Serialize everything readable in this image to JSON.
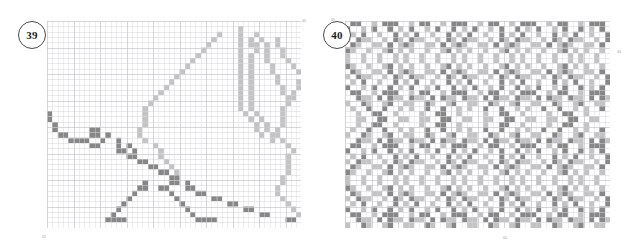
{
  "page": {
    "background": "#ffffff"
  },
  "colors": {
    "dark": "#878787",
    "light": "#c3c3c6",
    "empty": "#ffffff",
    "grid": "#d6d6d9",
    "grid_major": "#c4c4c8",
    "badge_border": "#4a4a4a",
    "badge_text": "#1d1d1d",
    "corner_mark": "#9a9a9a"
  },
  "charts": [
    {
      "id": "chart-39",
      "number": "39",
      "cols": 48,
      "rows": 39,
      "cell": 5.3,
      "corner_marks": [
        {
          "name": "mark-39-tr",
          "text": "40"
        },
        {
          "name": "mark-39-bl",
          "text": "42"
        }
      ],
      "legend": {
        "dark": "dark grey stitch",
        "light": "light grey stitch"
      },
      "grid_runs": [
        "48e",
        "36e,1l,11e",
        "32e,1l,3e,1l,2e,1l,7e",
        "31e,1l,4e,1l,1e,1l,1e,1l,2e,1l,5e",
        "30e,1l,5e,1l,1e,2l,1e,1l,1e,1l,5e",
        "29e,1l,6e,1l,2e,1l,1e,1l,2e,1l,4e",
        "28e,1l,7e,1l,1e,1l,2e,1l,2e,1l,3e",
        "27e,1l,8e,1l,1e,1l,2e,1l,3e,1l,2e",
        "26e,1l,9e,1l,1e,1l,3e,1l,3e,1l,1e",
        "25e,1l,10e,1l,1e,1l,3e,1l,4e,1l",
        "24e,1l,11e,1l,1e,1l,4e,1l,4e",
        "23e,1l,12e,1l,1e,1l,4e,1l,3e,1l",
        "22e,1l,13e,1l,1e,1l,5e,1l,2e,1l,1e",
        "21e,1l,14e,1l,1e,1l,5e,1l,1e,1l,2e",
        "20e,1l,15e,1l,1e,1l,6e,2l,3e",
        "19e,1l,16e,1l,1e,1l,6e,1l,4e",
        "18e,1l,17e,1l,1e,1l,5e,1l,5e",
        "1d,17e,1l,18e,1l,1e,1l,4e,1l,5e",
        "1d,17e,1l,19e,1l,1e,1l,3e,1l,5e",
        "1e,1d,16e,1l,20e,1l,1e,1l,2e,1l,5e",
        "1e,1d,6e,2d,7e,1l,21e,1l,1e,1l,1e,1l,5e",
        "2e,2d,4e,2d,1e,1d,5e,1l,22e,1l,1e,2l,5e",
        "4e,4d,2e,1d,2e,1d,4e,1l,23e,1l,1e,1l,5e",
        "8e,2d,3e,1d,1e,1d,4e,1l,24e,1l,6e",
        "13e,2d,1e,1d,4e,1l,24e,1l,1e,1l,4e",
        "15e,2d,4e,1l,23e,1l,2e,1l,4e",
        "17e,2d,3e,1l,22e,1l,3e,1l,4e",
        "19e,2d,2e,1l,21e,1l,4e,1l,4e",
        "21e,2d,1e,1l,20e,1l,5e,1l,4e",
        "23e,2d,19e,1l,6e,1l,4e",
        "18e,1d,4e,2d,1e,1d,17e,1l,7e,1l,4e",
        "17e,2d,2e,2d,3e,2d,15e,1l,8e,1l,4e",
        "16e,1d,6e,1d,4e,2d,13e,1l,9e,1l,4e",
        "15e,1d,8e,1d,6e,2d,11e,1l,10e,1l,4e",
        "14e,1d,10e,1d,8e,2d,9e,1l,11e,1l,4e",
        "13e,1d,12e,1d,10e,2d,7e,1l,12e,1l,4e",
        "12e,1d,14e,1d,12e,2d,5e,1l,13e,1l,4e",
        "11e,4d,13e,4d,13e,2d,3e,1l,14e,1l,3e",
        "48e"
      ]
    },
    {
      "id": "chart-40",
      "number": "40",
      "cols": 50,
      "rows": 39,
      "cell": 5.3,
      "corner_marks": [
        {
          "name": "mark-40-tl",
          "text": "40"
        },
        {
          "name": "mark-40-r",
          "text": "34"
        },
        {
          "name": "mark-40-b",
          "text": "00"
        }
      ],
      "legend": {
        "dark": "dark grey stitch",
        "light": "light grey stitch"
      },
      "grid_runs": [
        "1e,2d,2e,1l,1e,3d,2e,1l,1e,2d,2e,1l,1e,3d,2e,1l,1e,2d,2e,1l,1e,3d,2e,1l,1e,2d,2e,1l,1e,3d,2e,1l,1e,2d,2e,1l,1e,2d",
        "1d,2e,1l,1e,1d,2e,1d,1e,1l,1e,1d,2e,1l,1e,1d,2e,1d,1e,1l,1e,1d,2e,1l,1e,1d,2e,1d,1e,1l,1e,1d,2e,1l,1e,1d,2e,1d,1e,1l,1e,1d,2e,1l,1e,1d,1e",
        "1e,1l,1e,1d,2e,1l,2e,1d,1e,1l,1e,1d,2e,1l,2e,1d,1e,1l,1e,1d,2e,1l,2e,1d,1e,1l,1e,1d,2e,1l,2e,1d,1e,1l,1e,1d,2e,1l,2e,1d,1e,1l,1e,1d,2e,1l,2e,1d",
        "1l,1e,1d,2l,2e,1l,1e,1d,1l,1e,1d,2l,2e,1l,1e,1d,1l,1e,1d,2l,2e,1l,1e,1d,1l,1e,1d,2l,2e,1l,1e,1d,1l,1e,1d,2l,2e,1l,1e,1d,1l,1e,1d,1l",
        "1e,1d,1l,2e,2l,1e,1d,1e,1l,1d,1l,2e,2l,1e,1d,1e,1l,1d,1l,2e,2l,1e,1d,1e,1l,1d,1l,2e,2l,1e,1d,1e,1l,1d,1l,2e,2l,1e,1d,1e,1l,1d,1l,2e,2l,1e,1d",
        "1d,1l,2e,1l,2e,1l,1d,1e,1l,1e,1l,2e,1l,2e,1l,1d,1e,1l,1e,1l,2e,1l,2e,1l,1d,1e,1l,1e,1l,2e,1l,2e,1l,1d,1e,1l,1e,1l,2e,1l,2e,1l,1d,1e,1l,1e,1l,1e",
        "1l,2e,1l,2e,1l,2e,1l,1e,1l,2e,1l,2e,1l,2e,1l,1e,1l,2e,1l,2e,1l,2e,1l,1e,1l,2e,1l,2e,1l,2e,1l,1e,1l,2e,1l,2e,1l,2e,1l,1e,1l,2e,1l,2e,1l,1e",
        "1l,2e,1l,2e,1l,2e,1l,1e,1l,2e,1l,2e,1l,2e,1l,1e,1l,2e,1l,2e,1l,2e,1l,1e,1l,2e,1l,2e,1l,2e,1l,1e,1l,2e,1l,2e,1l,2e,1l,1e,1l,2e,1l,2e,1l,1e",
        "1d,1l,2e,1l,2e,1l,1d,1e,1l,1e,1l,2e,1l,2e,1l,1d,1e,1l,1e,1l,2e,1l,2e,1l,1d,1e,1l,1e,1l,2e,1l,2e,1l,1d,1e,1l,1e,1l,2e,1l,2e,1l,1d,1e,1l,1e,1l,1e",
        "1e,1d,1l,2e,2l,1e,1d,1e,1l,1d,1l,2e,2l,1e,1d,1e,1l,1d,1l,2e,2l,1e,1d,1e,1l,1d,1l,2e,2l,1e,1d,1e,1l,1d,1l,2e,2l,1e,1d,1e,1l,1d,1l,2e,2l,1e,1d",
        "1l,1e,1d,2l,2e,1l,1e,1d,1l,1e,1d,2l,2e,1l,1e,1d,1l,1e,1d,2l,2e,1l,1e,1d,1l,1e,1d,2l,2e,1l,1e,1d,1l,1e,1d,2l,2e,1l,1e,1d,1l,1e,1d,1l",
        "1e,1l,1e,1d,2e,1l,2e,1d,1e,1l,1e,1d,2e,1l,2e,1d,1e,1l,1e,1d,2e,1l,2e,1d,1e,1l,1e,1d,2e,1l,2e,1d,1e,1l,1e,1d,2e,1l,2e,1d,1e,1l,1e,1d,2e,1l,2e,1d",
        "1d,2e,1l,1e,1d,2e,1d,1e,1l,1e,1d,2e,1l,1e,1d,2e,1d,1e,1l,1e,1d,2e,1l,1e,1d,2e,1d,1e,1l,1e,1d,2e,1l,1e,1d,2e,1d,1e,1l,1e,1d,2e,1l,1e,1d,1e",
        "1e,2d,2e,1l,1e,3d,2e,1l,1e,2d,2e,1l,1e,3d,2e,1l,1e,2d,2e,1l,1e,3d,2e,1l,1e,2d,2e,1l,1e,3d,2e,1l,1e,2d,2e,1l,1e,2d",
        "2e,1d,2l,1e,1d,1e,1d,2l,1e,1d,2l,1e,1d,1e,1d,2l,1e,1d,2l,1e,1d,1e,1d,2l,1e,1d,2l,1e,1d,1e,1d,2l,1e,1d,2l,1e,1d,1e,1d,2l,1e,1d,2l,1e,1d,1e",
        "1l,2e,1d,1l,2e,1l,1d,2e,1l,1l,2e,1d,1l,2e,1l,1d,2e,1l,1l,2e,1d,1l,2e,1l,1d,2e,1l,1l,2e,1d,1l,2e,1l,1d,2e,1l,1l,2e,1d,1l,2e,1l,1d,1e",
        "1e,1l,2e,1d,2e,1d,2e,1l,1e,1l,2e,1d,2e,1d,2e,1l,1e,1l,2e,1d,2e,1d,2e,1l,1e,1l,2e,1d,2e,1d,2e,1l,1e,1l,2e,1d,2e,1d,2e,1l,1e,1l,2e,1d,2e,1d",
        "2e,1l,2e,2d,2e,1l,2e,2e,1l,2e,2d,2e,1l,2e,2e,1l,2e,2d,2e,1l,2e,2e,1l,2e,2d,2e,1l,2e,2e,1l,2e,2d,2e,1l,2e,2e,1l,2e,2d,2e",
        "2e,2l,2e,2d,2e,2l,2e,2l,2e,2d,2e,2l,2e,2l,2e,2d,2e,2l,2e,2l,2e,2d,2e,2l,2e,2l,2e,2d,2e,2l,2e,2l,2e,2d,2e",
        "2e,1l,2e,2d,2e,1l,2e,2e,1l,2e,2d,2e,1l,2e,2e,1l,2e,2d,2e,1l,2e,2e,1l,2e,2d,2e,1l,2e,2e,1l,2e,2d,2e,1l,2e,2e,1l,2e,2d,2e",
        "1e,1l,2e,1d,2e,1d,2e,1l,1e,1l,2e,1d,2e,1d,2e,1l,1e,1l,2e,1d,2e,1d,2e,1l,1e,1l,2e,1d,2e,1d,2e,1l,1e,1l,2e,1d,2e,1d,2e,1l,1e,1l,2e,1d,2e,1d",
        "1l,2e,1d,1l,2e,1l,1d,2e,1l,1l,2e,1d,1l,2e,1l,1d,2e,1l,1l,2e,1d,1l,2e,1l,1d,2e,1l,1l,2e,1d,1l,2e,1l,1d,2e,1l,1l,2e,1d,1l,2e,1l,1d,1e",
        "2e,1d,2l,1e,1d,1e,1d,2l,1e,1d,2l,1e,1d,1e,1d,2l,1e,1d,2l,1e,1d,1e,1d,2l,1e,1d,2l,1e,1d,1e,1d,2l,1e,1d,2l,1e,1d,1e,1d,2l,1e,1d,2l,1e,1d,1e",
        "1e,2d,2e,1l,1e,3d,2e,1l,1e,2d,2e,1l,1e,3d,2e,1l,1e,2d,2e,1l,1e,3d,2e,1l,1e,2d,2e,1l,1e,3d,2e,1l,1e,2d,2e,1l,1e,2d",
        "1d,2e,1l,1e,1d,2e,1d,1e,1l,1e,1d,2e,1l,1e,1d,2e,1d,1e,1l,1e,1d,2e,1l,1e,1d,2e,1d,1e,1l,1e,1d,2e,1l,1e,1d,2e,1d,1e,1l,1e,1d,2e,1l,1e,1d,1e",
        "1e,1l,1e,1d,2e,1l,2e,1d,1e,1l,1e,1d,2e,1l,2e,1d,1e,1l,1e,1d,2e,1l,2e,1d,1e,1l,1e,1d,2e,1l,2e,1d,1e,1l,1e,1d,2e,1l,2e,1d,1e,1l,1e,1d,2e,1l,2e,1d",
        "1l,1e,1d,2l,2e,1l,1e,1d,1l,1e,1d,2l,2e,1l,1e,1d,1l,1e,1d,2l,2e,1l,1e,1d,1l,1e,1d,2l,2e,1l,1e,1d,1l,1e,1d,2l,2e,1l,1e,1d,1l,1e,1d,1l",
        "1e,1d,1l,2e,2l,1e,1d,1e,1l,1d,1l,2e,2l,1e,1d,1e,1l,1d,1l,2e,2l,1e,1d,1e,1l,1d,1l,2e,2l,1e,1d,1e,1l,1d,1l,2e,2l,1e,1d,1e,1l,1d,1l,2e,2l,1e,1d",
        "1d,1l,2e,1l,2e,1l,1d,1e,1l,1e,1l,2e,1l,2e,1l,1d,1e,1l,1e,1l,2e,1l,2e,1l,1d,1e,1l,1e,1l,2e,1l,2e,1l,1d,1e,1l,1e,1l,2e,1l,2e,1l,1d,1e,1l,1e,1l,1e",
        "1l,2e,1l,2e,1l,2e,1l,1e,1l,2e,1l,2e,1l,2e,1l,1e,1l,2e,1l,2e,1l,2e,1l,1e,1l,2e,1l,2e,1l,2e,1l,1e,1l,2e,1l,2e,1l,2e,1l,1e,1l,2e,1l,2e,1l,1e",
        "1l,2e,1l,2e,1l,2e,1l,1e,1l,2e,1l,2e,1l,2e,1l,1e,1l,2e,1l,2e,1l,2e,1l,1e,1l,2e,1l,2e,1l,2e,1l,1e,1l,2e,1l,2e,1l,2e,1l,1e,1l,2e,1l,2e,1l,1e",
        "1d,1l,2e,1l,2e,1l,1d,1e,1l,1e,1l,2e,1l,2e,1l,1d,1e,1l,1e,1l,2e,1l,2e,1l,1d,1e,1l,1e,1l,2e,1l,2e,1l,1d,1e,1l,1e,1l,2e,1l,2e,1l,1d,1e,1l,1e,1l,1e",
        "1e,1d,1l,2e,2l,1e,1d,1e,1l,1d,1l,2e,2l,1e,1d,1e,1l,1d,1l,2e,2l,1e,1d,1e,1l,1d,1l,2e,2l,1e,1d,1e,1l,1d,1l,2e,2l,1e,1d,1e,1l,1d,1l,2e,2l,1e,1d",
        "1l,1e,1d,2l,2e,1l,1e,1d,1l,1e,1d,2l,2e,1l,1e,1d,1l,1e,1d,2l,2e,1l,1e,1d,1l,1e,1d,2l,2e,1l,1e,1d,1l,1e,1d,2l,2e,1l,1e,1d,1l,1e,1d,1l",
        "1e,1l,1e,1d,2e,1l,2e,1d,1e,1l,1e,1d,2e,1l,2e,1d,1e,1l,1e,1d,2e,1l,2e,1d,1e,1l,1e,1d,2e,1l,2e,1d,1e,1l,1e,1d,2e,1l,2e,1d,1e,1l,1e,1d,2e,1l,2e,1d",
        "1d,2e,1l,1e,1d,2e,1d,1e,1l,1e,1d,2e,1l,1e,1d,2e,1d,1e,1l,1e,1d,2e,1l,1e,1d,2e,1d,1e,1l,1e,1d,2e,1l,1e,1d,2e,1d,1e,1l,1e,1d,2e,1l,1e,1d,1e",
        "1e,2d,2e,1l,1e,3d,2e,1l,1e,2d,2e,1l,1e,3d,2e,1l,1e,2d,2e,1l,1e,3d,2e,1l,1e,2d,2e,1l,1e,3d,2e,1l,1e,2d,2e,1l,1e,2d",
        "2e,1d,2l,1e,1d,1e,1d,2l,1e,1d,2l,1e,1d,1e,1d,2l,1e,1d,2l,1e,1d,1e,1d,2l,1e,1d,2l,1e,1d,1e,1d,2l,1e,1d,2l,1e,1d,1e,1d,2l,1e,1d,2l,1e,1d,1e",
        "1l,2e,1d,1l,2e,1l,1d,2e,1l,1l,2e,1d,1l,2e,1l,1d,2e,1l,1l,2e,1d,1l,2e,1l,1d,2e,1l,1l,2e,1d,1l,2e,1l,1d,2e,1l,1l,2e,1d,1l,2e,1l,1d,1e"
      ]
    }
  ]
}
